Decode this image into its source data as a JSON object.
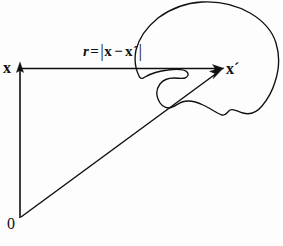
{
  "figure": {
    "background_color": "#fdfdfd",
    "stroke_color": "#101010",
    "labels": {
      "source_point": "x",
      "field_point": "x",
      "field_point_prime": "´",
      "origin": "0",
      "distance_r": "r",
      "distance_equals": "=",
      "distance_bar_open": "|",
      "distance_vec_x": "x",
      "distance_minus": "−",
      "distance_vec_x_prime": "x",
      "distance_prime": "´",
      "distance_bar_close": "|"
    },
    "geometry": {
      "origin_point": [
        20,
        218
      ],
      "source_point": [
        20,
        68
      ],
      "field_point": [
        222,
        68
      ],
      "vertical_arrow_tip": [
        20,
        63
      ],
      "horizontal_arrow_tip": [
        222,
        68
      ],
      "diagonal_arrow_tip": [
        222,
        69
      ],
      "blob_region_label": "volume-region-outline"
    }
  }
}
